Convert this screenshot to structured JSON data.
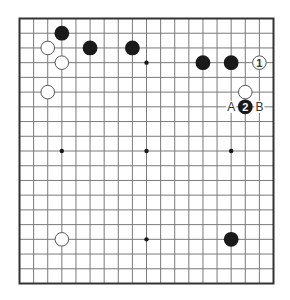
{
  "diagram": {
    "type": "go-board",
    "size": 19,
    "colors": {
      "background": "#ffffff",
      "grid_line": "#7a7a7a",
      "frame": "#333333",
      "black_stone": "#1a1a1a",
      "white_stone_fill": "#ffffff",
      "white_stone_stroke": "#555555",
      "label_text": "#333333"
    },
    "star_points": [
      [
        3,
        3
      ],
      [
        9,
        3
      ],
      [
        15,
        3
      ],
      [
        3,
        9
      ],
      [
        9,
        9
      ],
      [
        15,
        9
      ],
      [
        3,
        15
      ],
      [
        9,
        15
      ],
      [
        15,
        15
      ]
    ],
    "stones": [
      {
        "color": "black",
        "col": 3,
        "row": 1
      },
      {
        "color": "white",
        "col": 2,
        "row": 2
      },
      {
        "color": "black",
        "col": 5,
        "row": 2
      },
      {
        "color": "black",
        "col": 8,
        "row": 2
      },
      {
        "color": "white",
        "col": 3,
        "row": 3
      },
      {
        "color": "white",
        "col": 2,
        "row": 5
      },
      {
        "color": "black",
        "col": 13,
        "row": 3
      },
      {
        "color": "black",
        "col": 15,
        "row": 3
      },
      {
        "color": "white",
        "col": 17,
        "row": 3,
        "label": "1"
      },
      {
        "color": "white",
        "col": 16,
        "row": 5
      },
      {
        "color": "black",
        "col": 16,
        "row": 6,
        "label": "2"
      },
      {
        "color": "white",
        "col": 3,
        "row": 15
      },
      {
        "color": "black",
        "col": 15,
        "row": 15
      }
    ],
    "point_labels": [
      {
        "text": "A",
        "col": 15,
        "row": 6
      },
      {
        "text": "B",
        "col": 17,
        "row": 6
      }
    ]
  }
}
